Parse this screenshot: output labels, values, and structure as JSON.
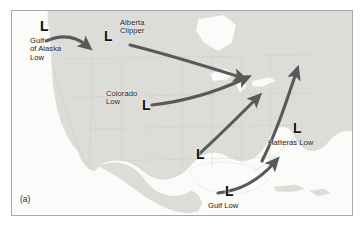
{
  "figure": {
    "caption_label": "(a)",
    "frame_color": "#a8a8a8",
    "arrow_color": "#595959",
    "land_color": "#dcdcd8",
    "water_color": "#fbfbfa",
    "low_marker": "L"
  },
  "systems": [
    {
      "id": "gulf-of-alaska-low",
      "marker": "L",
      "name": "Gulf\nof Alaska\nLow",
      "name_lines": [
        "Gulf",
        "of Alaska",
        "Low"
      ],
      "marker_x": 28,
      "marker_y": 8,
      "label_x": 18,
      "label_y": 26
    },
    {
      "id": "alberta-clipper",
      "marker": "L",
      "name": "Alberta\nClipper",
      "name_lines": [
        "Alberta",
        "Clipper"
      ],
      "marker_x": 92,
      "marker_y": 18,
      "label_x": 108,
      "label_y": 8
    },
    {
      "id": "colorado-low",
      "marker": "L",
      "name": "Colorado\nLow",
      "name_lines": [
        "Colorado",
        "Low"
      ],
      "marker_x": 130,
      "marker_y": 87,
      "label_x": 94,
      "label_y": 79
    },
    {
      "id": "central-low",
      "marker": "L",
      "name": "",
      "name_lines": [],
      "marker_x": 184,
      "marker_y": 136,
      "label_x": 0,
      "label_y": 0
    },
    {
      "id": "hatteras-low",
      "marker": "L",
      "name": "Hatteras Low",
      "name_lines": [
        "Hatteras Low"
      ],
      "marker_x": 281,
      "marker_y": 110,
      "label_x": 256,
      "label_y": 128
    },
    {
      "id": "gulf-low",
      "marker": "L",
      "name": "Gulf Low",
      "name_lines": [
        "Gulf Low"
      ],
      "marker_x": 213,
      "marker_y": 173,
      "label_x": 196,
      "label_y": 191
    }
  ],
  "storm_tracks": [
    {
      "id": "track-gulf-of-alaska",
      "from": "gulf-of-alaska-low",
      "direction": "eastward into Pacific Northwest"
    },
    {
      "id": "track-alberta-clipper",
      "from": "alberta-clipper",
      "direction": "southeast across the northern plains to the Great Lakes and Northeast"
    },
    {
      "id": "track-colorado",
      "from": "colorado-low",
      "direction": "northeast toward the Great Lakes and Northeast"
    },
    {
      "id": "track-central",
      "from": "central-low",
      "direction": "northeast toward the mid-Atlantic coast"
    },
    {
      "id": "track-hatteras",
      "from": "hatteras-low",
      "direction": "northeast up the Atlantic seaboard"
    },
    {
      "id": "track-gulf",
      "from": "gulf-low",
      "direction": "east-northeast across the Gulf toward the Carolinas"
    }
  ]
}
